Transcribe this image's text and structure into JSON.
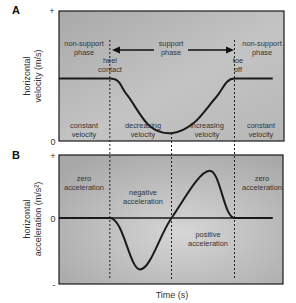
{
  "figure": {
    "panels": [
      {
        "id": "A",
        "letter": "A",
        "ylabel_line1": "horizontal",
        "ylabel_line2": "velocity (m/s)",
        "y_top_tick": "+",
        "y_bottom_tick": "0",
        "top_labels": {
          "left_phase": [
            "non-support",
            "phase"
          ],
          "middle_phase": [
            "support",
            "phase"
          ],
          "right_phase": [
            "non-support",
            "phase"
          ],
          "heel_contact": [
            "heel",
            "contact"
          ],
          "toe_off": [
            "toe",
            "off"
          ]
        },
        "bottom_labels": [
          [
            "constant",
            "velocity"
          ],
          [
            "decreasing",
            "velocity"
          ],
          [
            "increasing",
            "velocity"
          ],
          [
            "constant",
            "velocity"
          ]
        ]
      },
      {
        "id": "B",
        "letter": "B",
        "ylabel_line1": "horizontal",
        "ylabel_line2": "acceleration (m/s²)",
        "y_top_tick": "+",
        "y_zero_tick": "0",
        "y_bottom_tick": "-",
        "region_labels": {
          "left": [
            "zero",
            "acceleration"
          ],
          "negative": [
            "negative",
            "acceleration"
          ],
          "positive": [
            "positive",
            "acceleration"
          ],
          "right": [
            "zero",
            "acceleration"
          ]
        }
      }
    ],
    "xlabel": "Time (s)"
  },
  "chart_data": [
    {
      "type": "line",
      "title": "A",
      "xlabel": "Time (s)",
      "ylabel": "horizontal velocity (m/s)",
      "x_phase_boundaries": {
        "heel_contact": 0.226,
        "mid_support": 0.5,
        "toe_off": 0.78
      },
      "x": [
        0.0,
        0.226,
        0.3,
        0.4,
        0.5,
        0.6,
        0.7,
        0.78,
        0.95
      ],
      "series": [
        {
          "name": "velocity",
          "values": [
            0.48,
            0.48,
            0.36,
            0.12,
            0.06,
            0.14,
            0.34,
            0.48,
            0.48
          ]
        }
      ],
      "ylim": [
        0,
        1
      ],
      "yticks": [
        "0",
        "+"
      ]
    },
    {
      "type": "line",
      "title": "B",
      "xlabel": "Time (s)",
      "ylabel": "horizontal acceleration (m/s²)",
      "x_phase_boundaries": {
        "heel_contact": 0.226,
        "mid_support": 0.5,
        "toe_off": 0.78
      },
      "x": [
        0.0,
        0.226,
        0.36,
        0.5,
        0.67,
        0.78,
        0.95
      ],
      "series": [
        {
          "name": "acceleration",
          "values": [
            0,
            0,
            -0.78,
            0,
            0.75,
            0,
            0
          ]
        }
      ],
      "ylim": [
        -1,
        1
      ],
      "yticks": [
        "-",
        "0",
        "+"
      ]
    }
  ]
}
